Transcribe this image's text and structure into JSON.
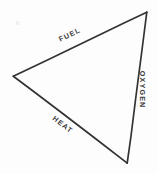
{
  "diagram": {
    "type": "triangle-diagram",
    "canvas": {
      "width": 157,
      "height": 174,
      "background_color": "#fdfdfd"
    },
    "stroke": {
      "color": "#333333",
      "width": 1.6,
      "style": "hand-drawn"
    },
    "vertices": [
      {
        "name": "top-vertex",
        "x": 147,
        "y": 12
      },
      {
        "name": "left-vertex",
        "x": 13,
        "y": 76
      },
      {
        "name": "bottom-vertex",
        "x": 127,
        "y": 163
      }
    ],
    "edges": [
      {
        "name": "fuel-edge",
        "label": "FUEL",
        "from": "left-vertex",
        "to": "top-vertex",
        "rotation_deg": -25.5
      },
      {
        "name": "oxygen-edge",
        "label": "OXYGEN",
        "from": "top-vertex",
        "to": "bottom-vertex",
        "rotation_deg": 90
      },
      {
        "name": "heat-edge",
        "label": "HEAT",
        "from": "bottom-vertex",
        "to": "left-vertex",
        "rotation_deg": 37.5
      }
    ],
    "artifacts": [
      {
        "name": "scan-speck",
        "x": 16,
        "y": 21,
        "color": "#eeeeee"
      }
    ]
  }
}
